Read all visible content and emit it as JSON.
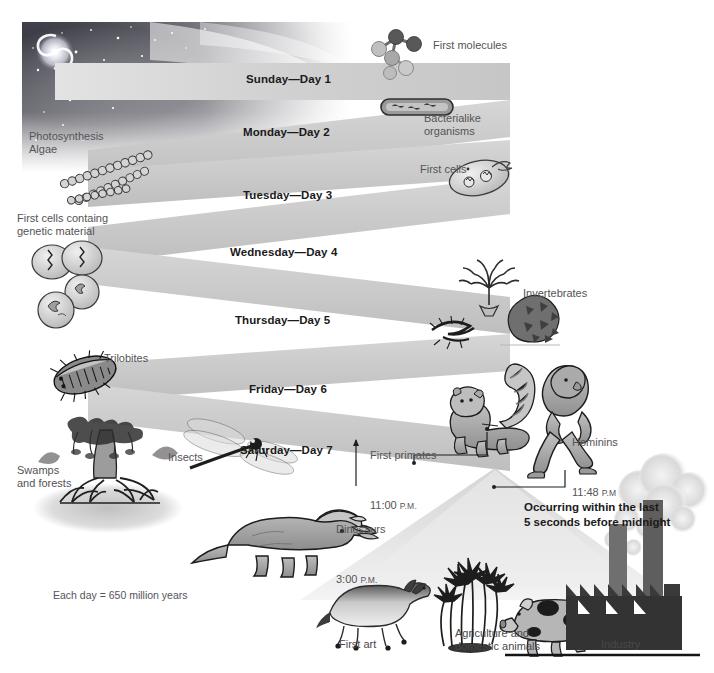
{
  "figure": {
    "footnote": "Each day = 650 million years",
    "zoom_note": "Occurring within the last\n5 seconds before midnight"
  },
  "days": [
    {
      "id": "day-1",
      "label": "Sunday—Day 1"
    },
    {
      "id": "day-2",
      "label": "Monday—Day 2"
    },
    {
      "id": "day-3",
      "label": "Tuesday—Day 3"
    },
    {
      "id": "day-4",
      "label": "Wednesday—Day 4"
    },
    {
      "id": "day-5",
      "label": "Thursday—Day 5"
    },
    {
      "id": "day-6",
      "label": "Friday—Day 6"
    },
    {
      "id": "day-7",
      "label": "Saturday—Day 7"
    }
  ],
  "events": {
    "first_molecules": "First molecules",
    "bacterialike": "Bacterialike\norganisms",
    "photosynthesis": "Photosynthesis\nAlgae",
    "first_cells": "First cells",
    "genetic_material": "First cells containg\ngenetic material",
    "invertebrates": "Invertebrates",
    "trilobites": "Trilobites",
    "swamps": "Swamps\nand forests",
    "insects": "Insects",
    "dinosaurs_name": "Dinosaurs",
    "dinosaurs_time_num": "3:00 ",
    "dinosaurs_time_unit": "P.M.",
    "primates_name": "First primates",
    "primates_time_num": "11:00 ",
    "primates_time_unit": "P.M.",
    "hominins_name": "Hominins",
    "hominins_time_num": "11:48 ",
    "hominins_time_unit": "P.M"
  },
  "modern": {
    "first_art": "First art",
    "agriculture": "Agriculture and\ndomestic animals",
    "industry": "Industry"
  },
  "colors": {
    "band": "#c9c9c9",
    "band_light": "#dcdcdc",
    "wedge": "#e2e2e2",
    "space_dark": "#2a2a33",
    "ink": "#231f20",
    "muted_text": "#55535a",
    "rule": "#141414"
  }
}
